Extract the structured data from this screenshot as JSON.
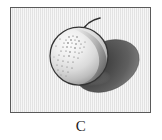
{
  "figure": {
    "caption": "C",
    "panel_label": "C",
    "style": "grayscale-stippled-line-drawing",
    "colors": {
      "page_background": "#ffffff",
      "panel_background": "#ececec",
      "frame_border": "#5a5a5a",
      "outline": "#3a3a3a",
      "fruit_highlight": "#f4f4f4",
      "fruit_midtone": "#cfcfcf",
      "fruit_shade": "#8f8f8f",
      "cast_shadow_dark": "#4a4a4a",
      "cast_shadow_mid": "#6e6e6e",
      "stipple": "#6a6a6a",
      "caption_text": "#1c1c1c"
    },
    "frame": {
      "x": 10,
      "y": 7,
      "width": 141,
      "height": 106,
      "border_width": 1
    },
    "elements": [
      {
        "name": "fruit-body",
        "shape": "circle",
        "cx": 68,
        "cy": 48,
        "r": 29
      },
      {
        "name": "fruit-stem",
        "shape": "curve",
        "from_x": 73,
        "from_y": 22,
        "to_x": 88,
        "to_y": 14
      },
      {
        "name": "stipple-cluster",
        "cx": 62,
        "cy": 35,
        "radius": 16,
        "dot_count": 46
      },
      {
        "name": "cast-shadow",
        "shape": "ellipse",
        "cx": 96,
        "cy": 58,
        "rx": 34,
        "ry": 25,
        "rotation": -28
      }
    ]
  }
}
